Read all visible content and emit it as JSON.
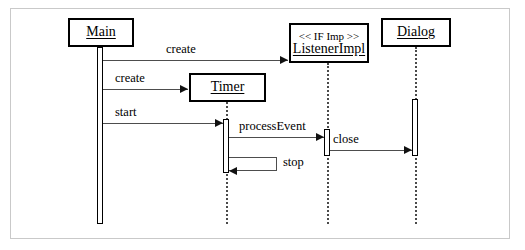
{
  "diagram": {
    "kind": "uml-sequence-diagram",
    "frame": {
      "border_color": "#c9c9c9",
      "background": "#ffffff"
    },
    "line_color": "#4d4d4d",
    "box_border_color": "#000000"
  },
  "participants": [
    {
      "id": "main",
      "name": "Main",
      "stereotype": "",
      "box": {
        "x": 67,
        "y": 17,
        "w": 66,
        "h": 29
      },
      "lifeline_x": 100,
      "lifeline_style": "solid",
      "lifeline_from": 46,
      "lifeline_to": 223
    },
    {
      "id": "timer",
      "name": "Timer",
      "stereotype": "",
      "box": {
        "x": 188,
        "y": 72,
        "w": 77,
        "h": 29
      },
      "lifeline_x": 226,
      "lifeline_style": "dotted",
      "lifeline_from": 101,
      "lifeline_to": 223
    },
    {
      "id": "listenerimpl",
      "name": "ListenerImpl",
      "stereotype": "<< IF Imp >>",
      "box": {
        "x": 288,
        "y": 22,
        "w": 80,
        "h": 40
      },
      "lifeline_x": 327,
      "lifeline_style": "dotted",
      "lifeline_from": 62,
      "lifeline_to": 223
    },
    {
      "id": "dialog",
      "name": "Dialog",
      "stereotype": "",
      "box": {
        "x": 380,
        "y": 17,
        "w": 70,
        "h": 29
      },
      "lifeline_x": 415,
      "lifeline_style": "dotted",
      "lifeline_from": 46,
      "lifeline_to": 223
    }
  ],
  "activations": [
    {
      "id": "act-main",
      "participant": "Main",
      "x": 97,
      "y": 46,
      "w": 6,
      "h": 177
    },
    {
      "id": "act-timer",
      "participant": "Timer",
      "x": 223,
      "y": 118,
      "w": 6,
      "h": 54
    },
    {
      "id": "act-listener",
      "participant": "ListenerImpl",
      "x": 324,
      "y": 128,
      "w": 6,
      "h": 27
    },
    {
      "id": "act-dialog",
      "participant": "Dialog",
      "x": 412,
      "y": 98,
      "w": 6,
      "h": 57
    }
  ],
  "messages": [
    {
      "id": "msg-create-listener",
      "label": "create",
      "from": "Main",
      "to": "ListenerImpl",
      "direction": "right",
      "y": 59,
      "x1": 103,
      "x2": 288,
      "label_x": 166,
      "label_y": 43
    },
    {
      "id": "msg-create-timer",
      "label": "create",
      "from": "Main",
      "to": "Timer",
      "direction": "right",
      "y": 88,
      "x1": 103,
      "x2": 188,
      "label_x": 115,
      "label_y": 72
    },
    {
      "id": "msg-start",
      "label": "start",
      "from": "Main",
      "to": "Timer",
      "direction": "right",
      "y": 122,
      "x1": 103,
      "x2": 223,
      "label_x": 115,
      "label_y": 106
    },
    {
      "id": "msg-processevent",
      "label": "processEvent",
      "from": "Timer",
      "to": "ListenerImpl",
      "direction": "right",
      "y": 136,
      "x1": 229,
      "x2": 324,
      "label_x": 239,
      "label_y": 120
    },
    {
      "id": "msg-close",
      "label": "close",
      "from": "ListenerImpl",
      "to": "Dialog",
      "direction": "right",
      "y": 149,
      "x1": 330,
      "x2": 412,
      "label_x": 333,
      "label_y": 133
    }
  ],
  "self_messages": [
    {
      "id": "msg-stop",
      "label": "stop",
      "participant": "Timer",
      "x": 229,
      "y": 156,
      "w": 48,
      "h": 14,
      "label_x": 283,
      "label_y": 154,
      "direction": "left"
    }
  ]
}
